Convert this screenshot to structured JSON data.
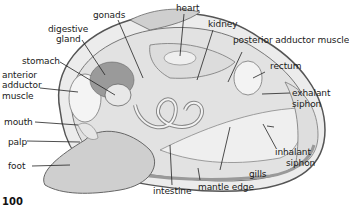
{
  "diagram": {
    "page_number": "100",
    "labels": {
      "gonads": "gonads",
      "heart": "heart",
      "kidney": "kidney",
      "digestive_gland_1": "digestive",
      "digestive_gland_2": "gland",
      "posterior_adductor_muscle": "posterior adductor muscle",
      "stomach": "stomach",
      "rectum": "rectum",
      "anterior_adductor_1": "anterior",
      "anterior_adductor_2": "adductor",
      "anterior_adductor_3": "muscle",
      "exhalant_siphon_1": "exhalant",
      "exhalant_siphon_2": "siphon",
      "mouth": "mouth",
      "palp": "palp",
      "foot": "foot",
      "inhalant_siphon_1": "inhalant",
      "inhalant_siphon_2": "siphon",
      "gills": "gills",
      "intestine": "intestine",
      "mantle_edge": "mantle edge"
    },
    "colors": {
      "line": "#222222",
      "shell_fill": "#e6e6e6",
      "shell_stroke": "#555555",
      "body_fill": "#d4d4d4",
      "digestive_fill": "#9a9a9a",
      "background": "#ffffff"
    }
  }
}
